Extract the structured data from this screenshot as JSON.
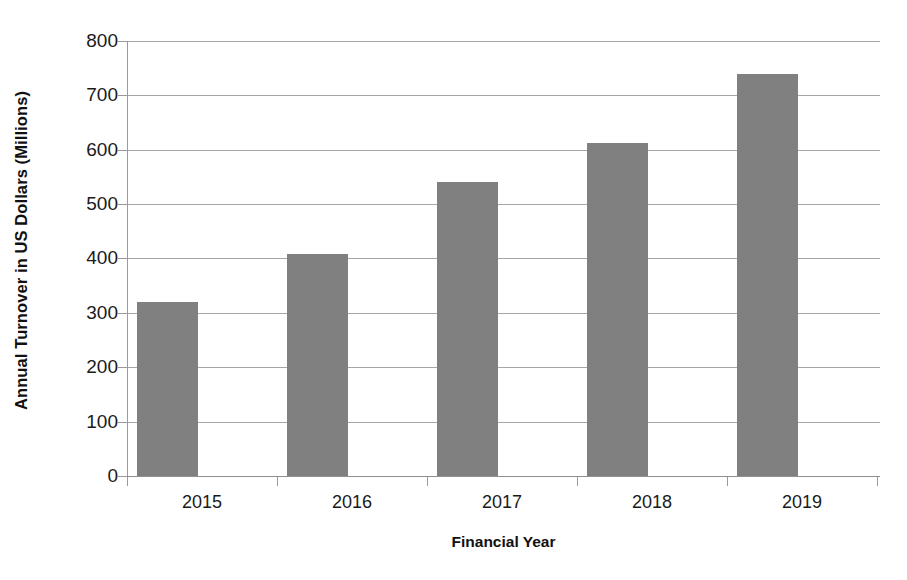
{
  "chart_data": {
    "type": "bar",
    "title": "",
    "xlabel": "Financial Year",
    "ylabel": "Annual Turnover in US Dollars (Millions)",
    "categories": [
      "2015",
      "2016",
      "2017",
      "2018",
      "2019"
    ],
    "values": [
      320,
      408,
      540,
      613,
      740
    ],
    "ylim": [
      0,
      800
    ],
    "ytick_labels": [
      "800",
      "700",
      "600",
      "500",
      "400",
      "300",
      "200",
      "100",
      "0"
    ],
    "ytick_values": [
      800,
      700,
      600,
      500,
      400,
      300,
      200,
      100,
      0
    ],
    "grid": true,
    "legend": null,
    "series": [
      {
        "name": "Annual Turnover",
        "values": [
          320,
          408,
          540,
          613,
          740
        ],
        "color": "#808080"
      }
    ],
    "colors": {
      "bar": "#808080",
      "gridline": "#a6a6a6",
      "axis": "#9a9a9a",
      "text": "#1a1a1a",
      "background": "#ffffff"
    }
  }
}
